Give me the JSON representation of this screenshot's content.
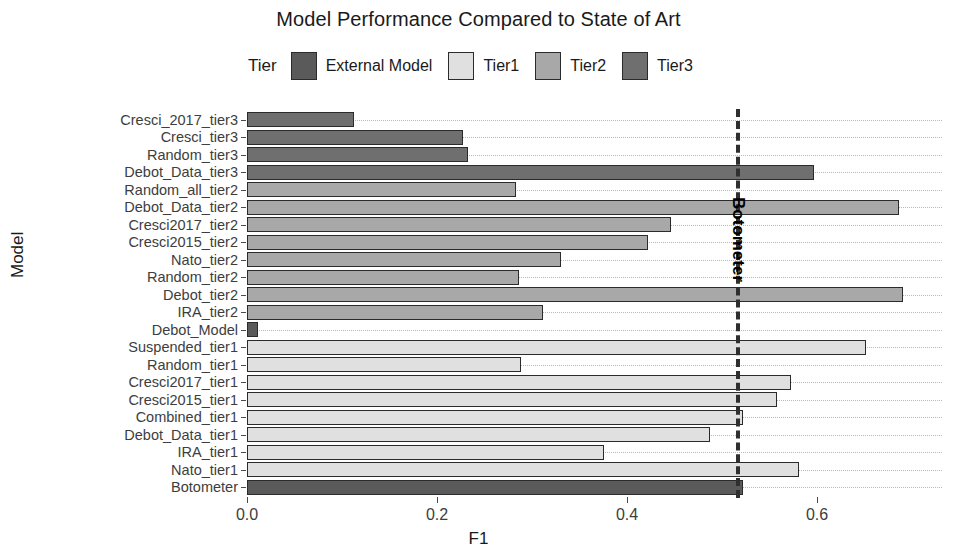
{
  "chart_data": {
    "type": "bar",
    "orientation": "horizontal",
    "title": "Model Performance Compared to State of Art",
    "xlabel": "F1",
    "ylabel": "Model",
    "xlim": [
      0.0,
      0.73
    ],
    "xticks": [
      0.0,
      0.2,
      0.4,
      0.6
    ],
    "xtick_labels": [
      "0.0",
      "0.2",
      "0.4",
      "0.6"
    ],
    "grid": "dotted-horizontal",
    "legend": {
      "title": "Tier",
      "position": "top",
      "entries": [
        {
          "label": "External Model",
          "color": "#5a5a5a"
        },
        {
          "label": "Tier1",
          "color": "#e0e0e0"
        },
        {
          "label": "Tier2",
          "color": "#a8a8a8"
        },
        {
          "label": "Tier3",
          "color": "#6f6f6f"
        }
      ]
    },
    "annotations": [
      {
        "name": "Botometer",
        "type": "vline",
        "value": 0.515,
        "style": "dashed",
        "color": "#2f2f2f"
      }
    ],
    "categories": [
      "Cresci_2017_tier3",
      "Cresci_tier3",
      "Random_tier3",
      "Debot_Data_tier3",
      "Random_all_tier2",
      "Debot_Data_tier2",
      "Cresci2017_tier2",
      "Cresci2015_tier2",
      "Nato_tier2",
      "Random_tier2",
      "Debot_tier2",
      "IRA_tier2",
      "Debot_Model",
      "Suspended_tier1",
      "Random_tier1",
      "Cresci2017_tier1",
      "Cresci2015_tier1",
      "Combined_tier1",
      "Debot_Data_tier1",
      "IRA_tier1",
      "Nato_tier1",
      "Botometer"
    ],
    "values": [
      0.113,
      0.227,
      0.233,
      0.597,
      0.283,
      0.686,
      0.446,
      0.422,
      0.331,
      0.286,
      0.69,
      0.312,
      0.012,
      0.652,
      0.288,
      0.573,
      0.558,
      0.522,
      0.487,
      0.376,
      0.581,
      0.522
    ],
    "tiers": [
      "Tier3",
      "Tier3",
      "Tier3",
      "Tier3",
      "Tier2",
      "Tier2",
      "Tier2",
      "Tier2",
      "Tier2",
      "Tier2",
      "Tier2",
      "Tier2",
      "External Model",
      "Tier1",
      "Tier1",
      "Tier1",
      "Tier1",
      "Tier1",
      "Tier1",
      "Tier1",
      "Tier1",
      "External Model"
    ]
  }
}
